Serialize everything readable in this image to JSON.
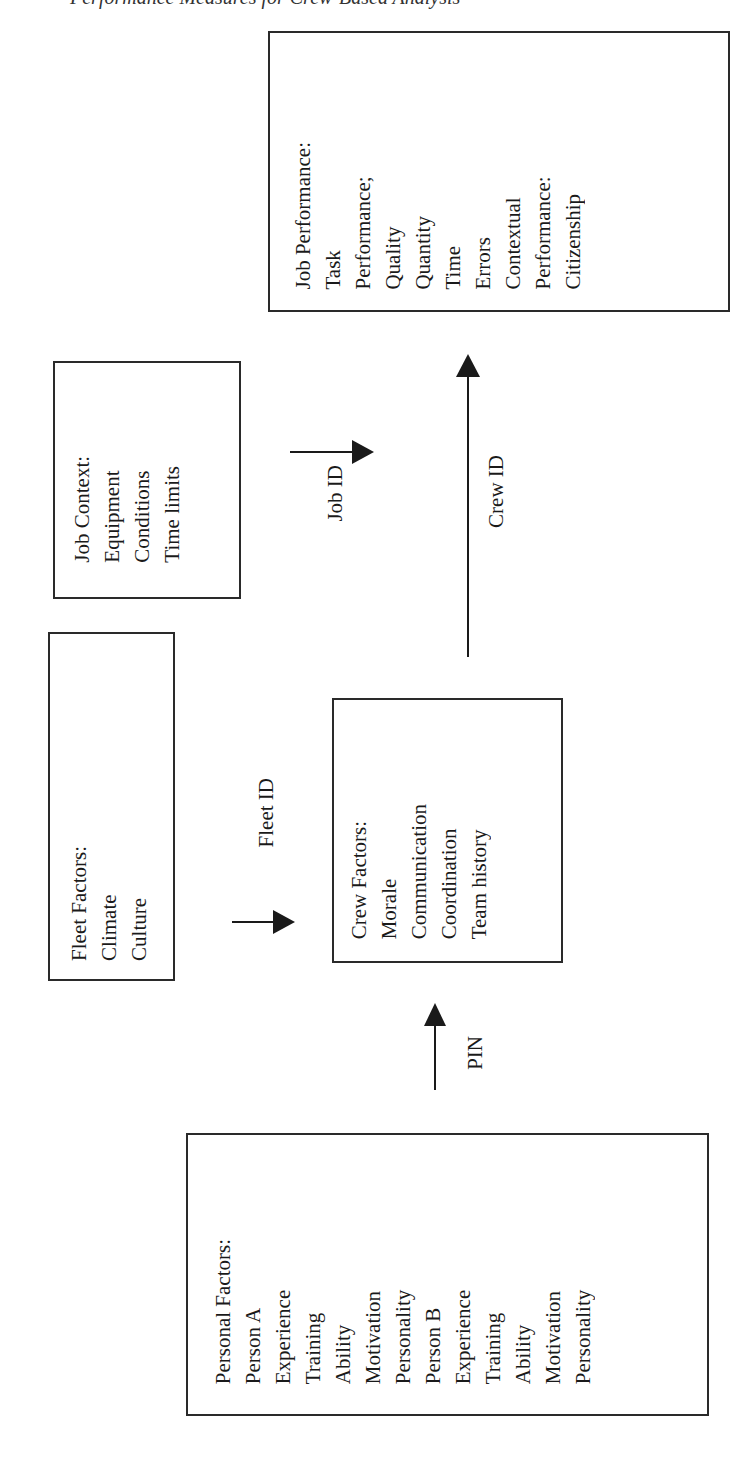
{
  "header_fragment": "Performance Measures for Crew-Based Analysis",
  "boxes": {
    "job_performance": {
      "title": "Job Performance:",
      "task_label": "Task",
      "task_sub": "Performance;",
      "task_items": [
        "Quality",
        "Quantity",
        "Time",
        "Errors"
      ],
      "contextual_label": "Contextual",
      "contextual_sub": "Performance:",
      "contextual_items": [
        "Citizenship"
      ]
    },
    "job_context": {
      "title": "Job Context:",
      "items": [
        "Equipment",
        "Conditions",
        "Time limits"
      ]
    },
    "fleet_factors": {
      "title": "Fleet Factors:",
      "items": [
        "Climate",
        "Culture"
      ]
    },
    "crew_factors": {
      "title": "Crew Factors:",
      "items": [
        "Morale",
        "Communication",
        "Coordination",
        "Team history"
      ]
    },
    "personal_factors": {
      "title": "Personal Factors:",
      "person_a": {
        "label": "Person A",
        "items": [
          "Experience",
          "Training",
          "Ability",
          "Motivation",
          "Personality"
        ]
      },
      "person_b": {
        "label": "Person B",
        "items": [
          "Experience",
          "Training",
          "Ability",
          "Motivation",
          "Personality"
        ]
      }
    }
  },
  "arrows": {
    "job_id": "Job ID",
    "crew_id": "Crew ID",
    "fleet_id": "Fleet ID",
    "pin": "PIN"
  }
}
